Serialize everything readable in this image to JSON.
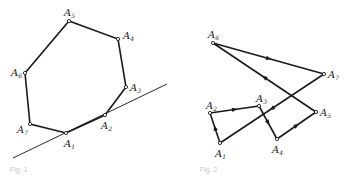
{
  "figures": [
    {
      "id": "fig1",
      "caption": "Fig. 1",
      "description": "Convex heptagon with supporting line through A1 and A2",
      "vertices": [
        {
          "name": "A1",
          "x": 66,
          "y": 133,
          "label_dx": -2,
          "label_dy": 14
        },
        {
          "name": "A2",
          "x": 105,
          "y": 115,
          "label_dx": -4,
          "label_dy": 14
        },
        {
          "name": "A3",
          "x": 126,
          "y": 87,
          "label_dx": 4,
          "label_dy": 4
        },
        {
          "name": "A4",
          "x": 118,
          "y": 39,
          "label_dx": 5,
          "label_dy": 0
        },
        {
          "name": "A5",
          "x": 69,
          "y": 21,
          "label_dx": -5,
          "label_dy": -5
        },
        {
          "name": "A6",
          "x": 25,
          "y": 73,
          "label_dx": -14,
          "label_dy": 3
        },
        {
          "name": "A7",
          "x": 30,
          "y": 124,
          "label_dx": -13,
          "label_dy": 9
        }
      ],
      "tangent_line": {
        "x1": 13,
        "y1": 158,
        "x2": 167,
        "y2": 84
      }
    },
    {
      "id": "fig2",
      "caption": "Fig. 2",
      "description": "Self-intersecting closed directed polygon A1→A2→…→A7→A1",
      "vertices": [
        {
          "name": "A1",
          "x": 220,
          "y": 143,
          "label_dx": -5,
          "label_dy": 14
        },
        {
          "name": "A2",
          "x": 210,
          "y": 113,
          "label_dx": -4,
          "label_dy": -4
        },
        {
          "name": "A3",
          "x": 259,
          "y": 106,
          "label_dx": -3,
          "label_dy": -4
        },
        {
          "name": "A4",
          "x": 277,
          "y": 139,
          "label_dx": -5,
          "label_dy": 14
        },
        {
          "name": "A5",
          "x": 316,
          "y": 112,
          "label_dx": 4,
          "label_dy": 4
        },
        {
          "name": "A6",
          "x": 213,
          "y": 43,
          "label_dx": -5,
          "label_dy": -5
        },
        {
          "name": "A7",
          "x": 324,
          "y": 74,
          "label_dx": 4,
          "label_dy": 4
        }
      ],
      "directed_edges": [
        [
          "A1",
          "A2"
        ],
        [
          "A2",
          "A3"
        ],
        [
          "A3",
          "A4"
        ],
        [
          "A4",
          "A5"
        ],
        [
          "A5",
          "A6"
        ],
        [
          "A6",
          "A7"
        ],
        [
          "A7",
          "A1"
        ]
      ]
    }
  ],
  "colors": {
    "stroke": "#1a1a1a",
    "background": "#ffffff",
    "caption": "#c8c8c8"
  }
}
